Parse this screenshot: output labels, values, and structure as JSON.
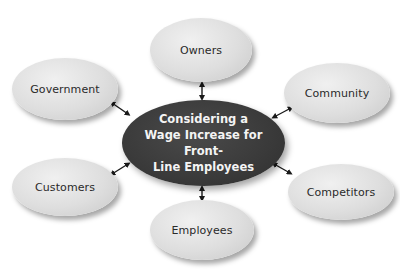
{
  "diagram": {
    "type": "hub-and-spoke",
    "center": {
      "lines": [
        "Considering a",
        "Wage Increase for Front-",
        "Line Employees"
      ]
    },
    "nodes": [
      {
        "id": "owners",
        "label": "Owners"
      },
      {
        "id": "government",
        "label": "Government"
      },
      {
        "id": "community",
        "label": "Community"
      },
      {
        "id": "customers",
        "label": "Customers"
      },
      {
        "id": "competitors",
        "label": "Competitors"
      },
      {
        "id": "employees",
        "label": "Employees"
      }
    ],
    "connector": "double-headed-arrow",
    "colors": {
      "center_fill": "#3a3a3a",
      "center_text": "#f4f4f4",
      "node_fill": "#dedede",
      "node_text": "#2a2a2a",
      "arrow": "#1a1a1a"
    }
  }
}
